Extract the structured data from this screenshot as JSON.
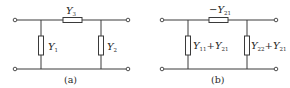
{
  "diagrams": [
    {
      "id": "a",
      "caption": "(a)",
      "series": {
        "symbol": "Y",
        "sub": "3",
        "prefix": ""
      },
      "shunt_left": {
        "parts": [
          {
            "t": "Y",
            "s": "1"
          }
        ]
      },
      "shunt_right": {
        "parts": [
          {
            "t": "Y",
            "s": "2"
          }
        ]
      }
    },
    {
      "id": "b",
      "caption": "(b)",
      "series": {
        "symbol": "Y",
        "sub": "21",
        "prefix": "−"
      },
      "shunt_left": {
        "parts": [
          {
            "t": "Y",
            "s": "11"
          },
          {
            "op": "+"
          },
          {
            "t": "Y",
            "s": "21"
          }
        ]
      },
      "shunt_right": {
        "parts": [
          {
            "t": "Y",
            "s": "22"
          },
          {
            "op": "+"
          },
          {
            "t": "Y",
            "s": "21"
          }
        ]
      }
    }
  ],
  "labels": {
    "a_series_sym": "Y",
    "a_series_sub": "3",
    "a_left_sym": "Y",
    "a_left_sub": "1",
    "a_right_sym": "Y",
    "a_right_sub": "2",
    "a_caption": "(a)",
    "b_series_prefix": "−",
    "b_series_sym": "Y",
    "b_series_sub": "21",
    "b_left_sym1": "Y",
    "b_left_sub1": "11",
    "b_left_op": "+",
    "b_left_sym2": "Y",
    "b_left_sub2": "21",
    "b_right_sym1": "Y",
    "b_right_sub1": "22",
    "b_right_op": "+",
    "b_right_sym2": "Y",
    "b_right_sub2": "21",
    "b_caption": "(b)"
  }
}
